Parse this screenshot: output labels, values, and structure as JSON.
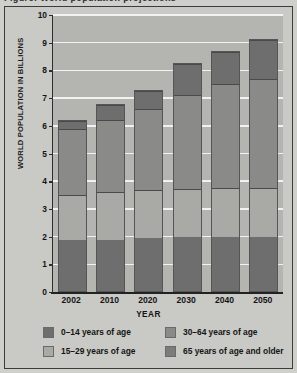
{
  "page": {
    "scan_artifact_text": "Figure: World population projections",
    "background_color": "#cfcfcb",
    "figure_background_color": "#c9c9c5",
    "plot_background_color": "#b4b4b0",
    "gridline_color": "#f2f2f0",
    "axis_color": "#222222"
  },
  "chart_data": {
    "type": "bar",
    "stacked": true,
    "title": "",
    "xlabel": "YEAR",
    "ylabel": "WORLD POPULATION IN BILLIONS",
    "categories": [
      "2002",
      "2010",
      "2020",
      "2030",
      "2040",
      "2050"
    ],
    "ylim": [
      0,
      10
    ],
    "yticks": [
      0,
      1,
      2,
      3,
      4,
      5,
      6,
      7,
      8,
      9,
      10
    ],
    "ytick_labels": [
      "0",
      "1",
      "2",
      "3",
      "4",
      "5",
      "6",
      "7",
      "8",
      "9",
      "10"
    ],
    "grid": true,
    "grid_axis": "y",
    "legend_position": "bottom",
    "series": [
      {
        "name": "0–14 years of age",
        "color": "#6e6e6e",
        "values": [
          1.85,
          1.85,
          1.95,
          1.95,
          1.95,
          1.95
        ]
      },
      {
        "name": "15–29 years of age",
        "color": "#a9a9a5",
        "values": [
          1.65,
          1.75,
          1.75,
          1.75,
          1.8,
          1.8
        ]
      },
      {
        "name": "30–64 years of age",
        "color": "#8a8a88",
        "values": [
          2.4,
          2.65,
          2.95,
          3.45,
          3.8,
          3.95
        ]
      },
      {
        "name": "65 years of age and older",
        "color": "#6e6e6e",
        "values": [
          0.3,
          0.55,
          0.65,
          1.1,
          1.15,
          1.45
        ]
      }
    ],
    "totals": [
      6.2,
      6.8,
      7.3,
      8.25,
      8.7,
      9.15
    ]
  },
  "legend": {
    "items": [
      {
        "label": "0–14 years of age",
        "color": "#6e6e6e"
      },
      {
        "label": "15–29 years of age",
        "color": "#a9a9a5"
      },
      {
        "label": "30–64 years of age",
        "color": "#8a8a88"
      },
      {
        "label": "65 years of age and older",
        "color": "#7c7c7a"
      }
    ]
  }
}
